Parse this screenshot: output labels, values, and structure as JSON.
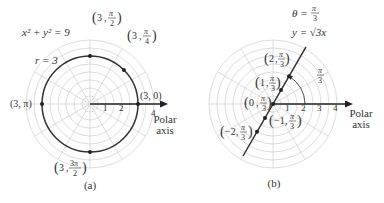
{
  "figure_a": {
    "caption": "(a)",
    "equation": "x² + y² = 9",
    "radius_label": "r = 3",
    "axis_label_line1": "Polar",
    "axis_label_line2": "axis",
    "ticks": [
      "1",
      "2",
      "4"
    ],
    "points": [
      {
        "label": "(3, 0)",
        "r": 3,
        "theta_deg": 0
      },
      {
        "label_r": "3",
        "label_theta_num": "π",
        "label_theta_den": "4",
        "r": 3,
        "theta_deg": 45
      },
      {
        "label_r": "3",
        "label_theta_num": "π",
        "label_theta_den": "2",
        "r": 3,
        "theta_deg": 90
      },
      {
        "label": "(3, π)",
        "r": 3,
        "theta_deg": 180
      },
      {
        "label_r": "3",
        "label_theta_num": "3π",
        "label_theta_den": "2",
        "r": 3,
        "theta_deg": 270
      }
    ]
  },
  "figure_b": {
    "caption": "(b)",
    "theta_eq_lhs": "θ =",
    "theta_eq_num": "π",
    "theta_eq_den": "3",
    "line_eq": "y = √3x",
    "angle_num": "π",
    "angle_den": "3",
    "axis_label_line1": "Polar",
    "axis_label_line2": "axis",
    "ticks": [
      "1",
      "2",
      "3",
      "4"
    ],
    "points": [
      {
        "label_r": "2",
        "label_theta_num": "π",
        "label_theta_den": "3",
        "r": 2
      },
      {
        "label_r": "1",
        "label_theta_num": "π",
        "label_theta_den": "3",
        "r": 1
      },
      {
        "label_r": "0",
        "label_theta_num": "π",
        "label_theta_den": "3",
        "r": 0
      },
      {
        "label_r": "−1",
        "label_theta_num": "π",
        "label_theta_den": "3",
        "r": -1
      },
      {
        "label_r": "−2",
        "label_theta_num": "π",
        "label_theta_den": "3",
        "r": -2
      }
    ]
  }
}
